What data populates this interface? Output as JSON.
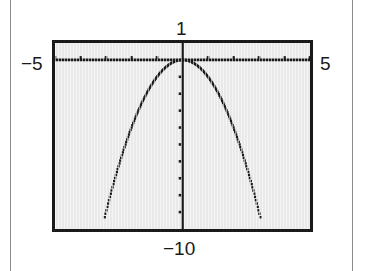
{
  "figure": {
    "kind": "graphing-calculator-screen",
    "window_labels": {
      "ymax": "1",
      "xmin": "−5",
      "xmax": "5",
      "ymin": "−10"
    },
    "colors": {
      "ink": "#1a1a1a",
      "screen_background": "#e9e9e9",
      "page_rule": "#8d8d8d",
      "page_background": "#ffffff"
    }
  },
  "chart_data": {
    "type": "line",
    "title": "",
    "subtitle": "",
    "xlabel": "",
    "ylabel": "",
    "xlim": [
      -5,
      5
    ],
    "ylim": [
      -10,
      1
    ],
    "grid": false,
    "legend": null,
    "axes": {
      "x_axis_y_value": 0,
      "y_axis_x_value": 0,
      "x_tick_spacing": 1,
      "y_tick_spacing": 1,
      "x_tick_values": [
        -5,
        -4,
        -3,
        -2,
        -1,
        1,
        2,
        3,
        4,
        5
      ],
      "y_tick_values": [
        -9,
        -8,
        -7,
        -6,
        -5,
        -4,
        -3,
        -2,
        -1
      ],
      "tick_marks_visible": true,
      "tick_style": "dotted-marks-on-axis-lines"
    },
    "annotations": [
      {
        "text": "1",
        "position": "above-screen-top-center",
        "meaning": "Ymax"
      },
      {
        "text": "−5",
        "position": "left-of-screen-at-x-axis",
        "meaning": "Xmin"
      },
      {
        "text": "5",
        "position": "right-of-screen-at-x-axis",
        "meaning": "Xmax"
      },
      {
        "text": "−10",
        "position": "below-screen-bottom-center",
        "meaning": "Ymin"
      }
    ],
    "series": [
      {
        "name": "parabola",
        "equation": "y = -x^2",
        "style": "dotted-pixel-trace",
        "vertex": [
          0,
          0
        ],
        "opens": "down",
        "x": [
          -3.05,
          -2.9,
          -2.75,
          -2.6,
          -2.45,
          -2.3,
          -2.15,
          -2.0,
          -1.85,
          -1.7,
          -1.55,
          -1.4,
          -1.25,
          -1.1,
          -0.95,
          -0.8,
          -0.65,
          -0.5,
          -0.35,
          -0.2,
          0,
          0.2,
          0.35,
          0.5,
          0.65,
          0.8,
          0.95,
          1.1,
          1.25,
          1.4,
          1.55,
          1.7,
          1.85,
          2.0,
          2.15,
          2.3,
          2.45,
          2.6,
          2.75,
          2.9,
          3.05
        ],
        "values": [
          -9.3,
          -8.41,
          -7.56,
          -6.76,
          -6.0,
          -5.29,
          -4.62,
          -4.0,
          -3.42,
          -2.89,
          -2.4,
          -1.96,
          -1.56,
          -1.21,
          -0.9,
          -0.64,
          -0.42,
          -0.25,
          -0.12,
          -0.04,
          0,
          -0.04,
          -0.12,
          -0.25,
          -0.42,
          -0.64,
          -0.9,
          -1.21,
          -1.56,
          -1.96,
          -2.4,
          -2.89,
          -3.42,
          -4.0,
          -4.62,
          -5.29,
          -6.0,
          -6.76,
          -7.56,
          -8.41,
          -9.3
        ]
      }
    ]
  }
}
